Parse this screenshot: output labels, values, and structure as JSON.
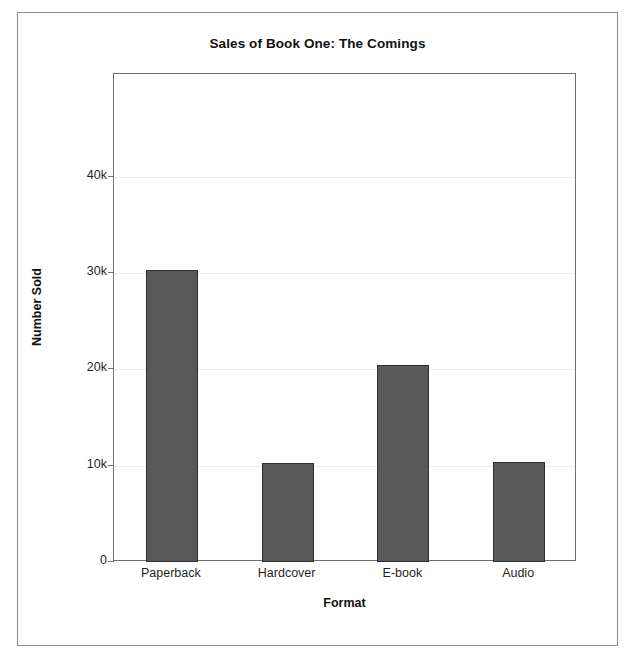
{
  "figure": {
    "background_color": "#ffffff",
    "border_color": "#8d8d8d",
    "plot_frame_color": "#6f6f6f"
  },
  "chart_data": {
    "type": "bar",
    "title": "Sales of Book One: The Comings",
    "xlabel": "Format",
    "ylabel": "Number Sold",
    "categories": [
      "Paperback",
      "Hardcover",
      "E-book",
      "Audio"
    ],
    "values": [
      30300,
      10300,
      20500,
      10400
    ],
    "ytick_labels": [
      "0",
      "10k",
      "20k",
      "30k",
      "40k"
    ],
    "ytick_values": [
      0,
      10000,
      20000,
      30000,
      40000
    ],
    "ylim": [
      0,
      50700
    ],
    "xlim_note": "categorical",
    "grid": "horizontal light gridlines at y ticks",
    "legend": "none",
    "bar_color": "#595959",
    "bar_edge_color": "#2f2f2f"
  }
}
